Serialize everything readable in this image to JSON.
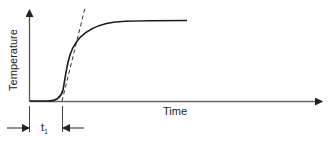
{
  "diagram": {
    "type": "temperature-time response curve",
    "y_axis": {
      "label": "Temperature"
    },
    "x_axis": {
      "label": "Time"
    },
    "annotation": {
      "base": "t",
      "subscript": "1",
      "meaning": "delay time interval marked between arrows"
    },
    "curve": {
      "shape": "S-shaped rise from baseline to plateau",
      "tangent": "dashed line at inflection point"
    },
    "colors": {
      "line": "#1a1a1a",
      "axis": "#444444",
      "background": "#ffffff"
    }
  }
}
